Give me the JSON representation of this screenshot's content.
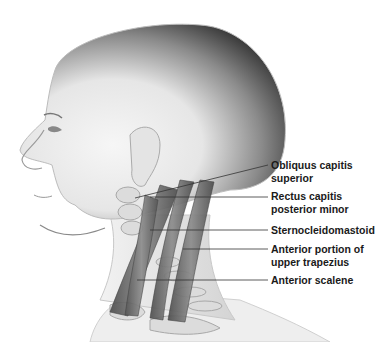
{
  "figure": {
    "labels": [
      {
        "id": "obliquus",
        "lines": [
          "Obliquus capitis",
          "superior"
        ],
        "top": 159
      },
      {
        "id": "rectus",
        "lines": [
          "Rectus capitis",
          "posterior minor"
        ],
        "top": 190
      },
      {
        "id": "scm",
        "lines": [
          "Sternocleidomastoid"
        ],
        "top": 224
      },
      {
        "id": "trapezius",
        "lines": [
          "Anterior portion of",
          "upper trapezius"
        ],
        "top": 243
      },
      {
        "id": "scalene",
        "lines": [
          "Anterior scalene"
        ],
        "top": 274
      }
    ],
    "leaders": [
      {
        "x1": 135,
        "y1": 198,
        "x2": 268,
        "y2": 165
      },
      {
        "x1": 150,
        "y1": 197,
        "x2": 268,
        "y2": 197
      },
      {
        "x1": 150,
        "y1": 230,
        "x2": 268,
        "y2": 230
      },
      {
        "x1": 183,
        "y1": 249,
        "x2": 268,
        "y2": 249
      },
      {
        "x1": 137,
        "y1": 280,
        "x2": 268,
        "y2": 280
      }
    ],
    "colors": {
      "skin": "#ececec",
      "head_shadow": "#3a3a3a",
      "muscle": "#6a6a6a",
      "bone": "#d8d8d8",
      "leader": "#333333",
      "text": "#1a1a1a"
    }
  }
}
